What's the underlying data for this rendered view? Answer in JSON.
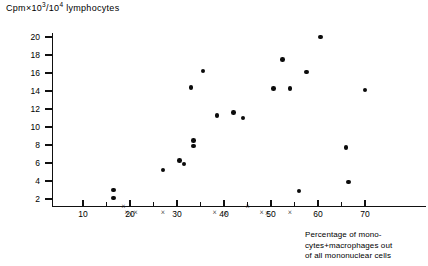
{
  "figure": {
    "y_axis_label_prefix": "Cpm",
    "y_axis_label": "Cpm×10³/10⁴ lymphocytes",
    "x_axis_caption": "Percentage of mono-\ncytes+macrophages out\nof all mononuclear cells"
  },
  "chart_data": {
    "type": "scatter",
    "title": "",
    "ylabel": "Cpm×10³/10⁴ lymphocytes",
    "xlabel": "Percentage of monocytes+macrophages out of all mononuclear cells",
    "xlim": [
      0,
      72
    ],
    "ylim": [
      0,
      21
    ],
    "xticks": [
      10,
      20,
      30,
      40,
      50,
      60,
      70
    ],
    "yticks": [
      2,
      4,
      6,
      8,
      10,
      12,
      14,
      16,
      18,
      20
    ],
    "x_minor_ticks": [
      15,
      25,
      35,
      45,
      55,
      65
    ],
    "grid": false,
    "legend": "none",
    "series": [
      {
        "name": "filled-circle",
        "marker": "circle",
        "color": "#0b0b0b",
        "points": [
          {
            "x": 16.5,
            "y": 3.0
          },
          {
            "x": 16.5,
            "y": 2.1
          },
          {
            "x": 27.0,
            "y": 5.2
          },
          {
            "x": 30.5,
            "y": 6.3
          },
          {
            "x": 33.0,
            "y": 14.4
          },
          {
            "x": 35.5,
            "y": 16.2
          },
          {
            "x": 33.5,
            "y": 8.5
          },
          {
            "x": 33.5,
            "y": 7.9
          },
          {
            "x": 31.5,
            "y": 5.9
          },
          {
            "x": 38.5,
            "y": 11.3
          },
          {
            "x": 42.0,
            "y": 11.6
          },
          {
            "x": 44.0,
            "y": 11.0
          },
          {
            "x": 50.5,
            "y": 14.3
          },
          {
            "x": 52.5,
            "y": 17.5
          },
          {
            "x": 54.0,
            "y": 14.3
          },
          {
            "x": 56.0,
            "y": 2.9
          },
          {
            "x": 57.5,
            "y": 16.1
          },
          {
            "x": 60.5,
            "y": 20.0
          },
          {
            "x": 66.0,
            "y": 7.7
          },
          {
            "x": 66.5,
            "y": 3.9
          },
          {
            "x": 70.0,
            "y": 14.1
          }
        ]
      },
      {
        "name": "cross",
        "marker": "x",
        "color": "#0b0b0b",
        "points": [
          {
            "x": 18.6,
            "y": 1.2
          },
          {
            "x": 19.3,
            "y": 0.45
          },
          {
            "x": 20.2,
            "y": 0.3
          },
          {
            "x": 21.2,
            "y": 0.5
          },
          {
            "x": 27.0,
            "y": 0.5
          },
          {
            "x": 38.0,
            "y": 0.5
          },
          {
            "x": 40.3,
            "y": 0.35
          },
          {
            "x": 45.0,
            "y": 1.2
          },
          {
            "x": 48.0,
            "y": 0.5
          },
          {
            "x": 49.2,
            "y": 0.35
          },
          {
            "x": 54.0,
            "y": 0.5
          }
        ]
      }
    ]
  }
}
